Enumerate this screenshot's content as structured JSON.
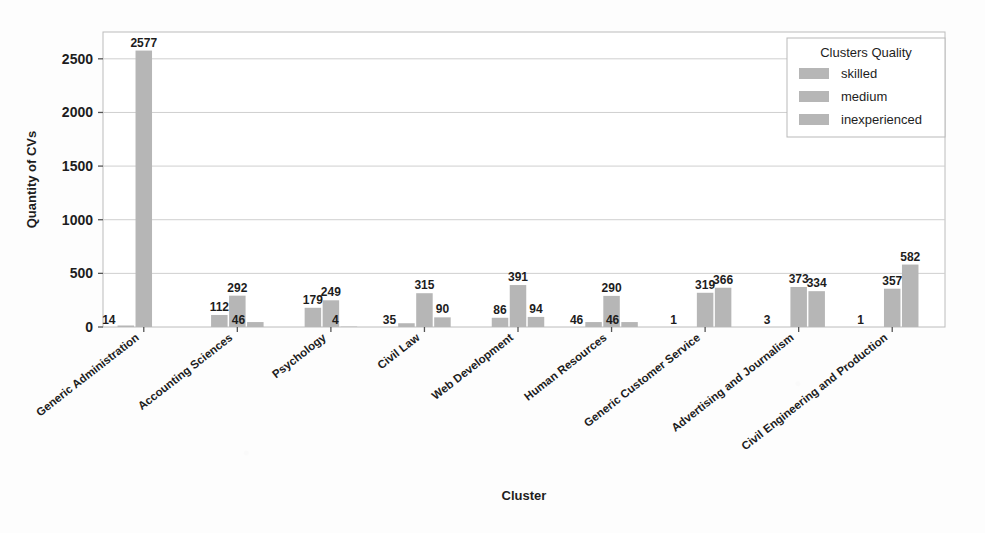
{
  "chart_data": {
    "type": "bar",
    "title": "",
    "xlabel": "Cluster",
    "ylabel": "Quantity of CVs",
    "ylim": [
      0,
      2750
    ],
    "yticks": [
      0,
      500,
      1000,
      1500,
      2000,
      2500
    ],
    "ytick_labels": [
      "0",
      "500",
      "1000",
      "1500",
      "2000",
      "2500"
    ],
    "grid": true,
    "legend_position": "top-right",
    "legend_title": "Clusters Quality",
    "bar_color": "#b6b6b6",
    "categories": [
      "Generic Administration",
      "Accounting Sciences",
      "Psychology",
      "Civil Law",
      "Web Development",
      "Human Resources",
      "Generic Customer Service",
      "Advertising and Journalism",
      "Civil Engineering and Production"
    ],
    "series": [
      {
        "name": "skilled",
        "values": [
          14,
          112,
          179,
          35,
          86,
          46,
          1,
          3,
          1
        ]
      },
      {
        "name": "medium",
        "values": [
          2577,
          292,
          249,
          315,
          391,
          290,
          319,
          373,
          357
        ]
      },
      {
        "name": "inexperienced",
        "values": [
          0,
          46,
          4,
          90,
          94,
          46,
          366,
          334,
          582
        ]
      }
    ],
    "value_labels": [
      [
        "14",
        "2577",
        ""
      ],
      [
        "112",
        "292",
        "46"
      ],
      [
        "179",
        "249",
        "4"
      ],
      [
        "35",
        "315",
        "90"
      ],
      [
        "86",
        "391",
        "94"
      ],
      [
        "46",
        "290",
        "46"
      ],
      [
        "1",
        "319",
        "366"
      ],
      [
        "3",
        "373",
        "334"
      ],
      [
        "1",
        "357",
        "582"
      ]
    ]
  },
  "legend": {
    "title": "Clusters Quality",
    "items": [
      {
        "label": "skilled",
        "color": "#b6b6b6"
      },
      {
        "label": "medium",
        "color": "#b6b6b6"
      },
      {
        "label": "inexperienced",
        "color": "#b6b6b6"
      }
    ]
  },
  "axes": {
    "x_title": "Cluster",
    "y_title": "Quantity of CVs"
  }
}
